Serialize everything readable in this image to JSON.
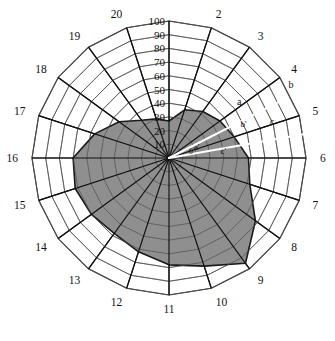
{
  "chart_data": {
    "type": "area",
    "subtype": "polar-radar",
    "title": "",
    "xlabel": "",
    "ylabel": "",
    "rlim": [
      0,
      100
    ],
    "grid": true,
    "legend": null,
    "center": {
      "x": 169,
      "y": 158
    },
    "radius_px": 137,
    "radial_ticks": [
      10,
      20,
      30,
      40,
      50,
      60,
      70,
      80,
      90,
      100
    ],
    "radial_tick_labels": [
      "10",
      "20",
      "30",
      "40",
      "50",
      "60",
      "70",
      "80",
      "90",
      "100"
    ],
    "radial_tick_angle_deg": 90,
    "n_spokes": 20,
    "spoke_step_deg": 18,
    "spoke_labels": [
      "1",
      "2",
      "3",
      "4",
      "5",
      "6",
      "7",
      "8",
      "9",
      "10",
      "11",
      "12",
      "13",
      "14",
      "15",
      "16",
      "17",
      "18",
      "19",
      "20"
    ],
    "spoke_label_visible": [
      "",
      "2",
      "3",
      "4",
      "5",
      "6",
      "7",
      "8",
      "9",
      "10",
      "11",
      "12",
      "13",
      "14",
      "15",
      "16",
      "17",
      "18",
      "19",
      "20"
    ],
    "categories": [
      "1",
      "2",
      "3",
      "4",
      "5",
      "6",
      "7",
      "8",
      "9",
      "10",
      "11",
      "12",
      "13",
      "14",
      "15",
      "16",
      "17",
      "18",
      "19",
      "20"
    ],
    "values": [
      27,
      37,
      42,
      46,
      50,
      58,
      62,
      78,
      95,
      83,
      78,
      72,
      68,
      70,
      72,
      70,
      57,
      45,
      34,
      30
    ],
    "series": [
      {
        "name": "shaded-region",
        "fill": "#8f8f8f",
        "stroke": "#1a1a1a",
        "values": [
          27,
          37,
          42,
          46,
          50,
          58,
          62,
          78,
          95,
          83,
          78,
          72,
          68,
          70,
          72,
          70,
          57,
          45,
          34,
          30
        ]
      }
    ],
    "annotations": {
      "outer_labels": [
        {
          "text": "a",
          "spoke_between": "3-4",
          "radius": 62
        },
        {
          "text": "b",
          "spoke_between": "4-5",
          "radius": 103
        },
        {
          "text": "c",
          "spoke_between": "5-6",
          "radius": 72
        }
      ],
      "inner_labels": [
        {
          "text": "θ",
          "radius": 14,
          "note": "angle between c' and a'"
        },
        {
          "text": "a'",
          "radius": 22
        },
        {
          "text": "b'",
          "radius": 52
        },
        {
          "text": "c'",
          "radius": 36
        }
      ],
      "rays": [
        {
          "name": "ray-upper",
          "color": "#ffffff",
          "angle_deg": 27,
          "length": 93
        },
        {
          "name": "ray-lower",
          "color": "#ffffff",
          "angle_deg": 10,
          "length": 108
        }
      ]
    }
  },
  "colors": {
    "fill": "#8f8f8f",
    "stroke": "#1a1a1a",
    "grid": "#4a4a4a",
    "spoke": "#111111",
    "annotation": "#ffffff",
    "background": "#ffffff",
    "text": "#111111"
  }
}
